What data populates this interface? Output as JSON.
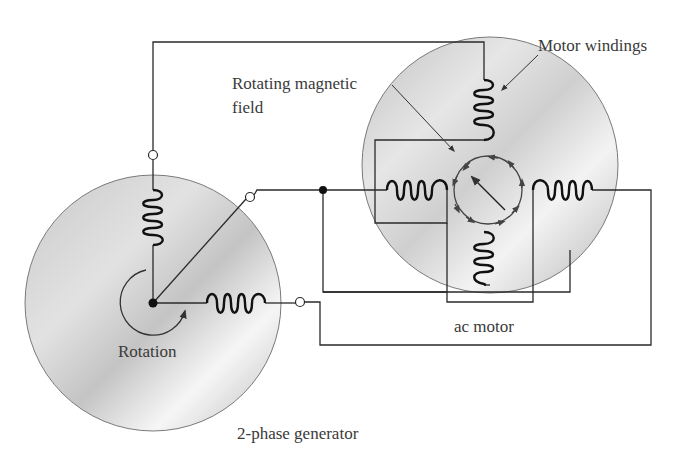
{
  "diagram": {
    "labels": {
      "motor_windings": "Motor windings",
      "rotating_field_line1": "Rotating magnetic",
      "rotating_field_line2": "field",
      "ac_motor": "ac motor",
      "rotation": "Rotation",
      "generator": "2-phase generator"
    },
    "components": [
      {
        "id": "generator",
        "type": "disc",
        "label": "2-phase generator"
      },
      {
        "id": "gen-coil-vertical",
        "type": "coil",
        "orientation": "vertical"
      },
      {
        "id": "gen-coil-horizontal",
        "type": "coil",
        "orientation": "horizontal"
      },
      {
        "id": "motor",
        "type": "disc",
        "label": "ac motor"
      },
      {
        "id": "motor-coil-top",
        "type": "coil",
        "orientation": "vertical"
      },
      {
        "id": "motor-coil-bottom",
        "type": "coil",
        "orientation": "vertical"
      },
      {
        "id": "motor-coil-left",
        "type": "coil",
        "orientation": "horizontal"
      },
      {
        "id": "motor-coil-right",
        "type": "coil",
        "orientation": "horizontal"
      },
      {
        "id": "rotating-field",
        "type": "circular-arrow-field"
      }
    ],
    "colors": {
      "line": "#2a2a2a",
      "disc_light": "#f2f2f2",
      "disc_dark": "#b8b8b8",
      "text": "#3a3a3a"
    }
  }
}
